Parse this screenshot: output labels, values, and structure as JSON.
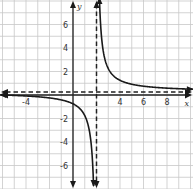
{
  "chart_data": {
    "type": "line",
    "title": "",
    "xlabel": "x",
    "ylabel": "y",
    "xlim": [
      -6.2,
      10.2
    ],
    "ylim": [
      -8,
      8
    ],
    "grid": true,
    "x_tick_labels": [
      "-4",
      "4",
      "6",
      "8"
    ],
    "x_tick_values": [
      -4,
      4,
      6,
      8
    ],
    "y_tick_labels": [
      "6",
      "4",
      "2",
      "-2",
      "-4",
      "-6"
    ],
    "y_tick_values": [
      6,
      4,
      2,
      -2,
      -4,
      -6
    ],
    "function": "y = 2/(x - 2) + 0.25",
    "asymptotes": {
      "vertical": {
        "x": 2,
        "style": "dashed"
      },
      "horizontal": {
        "y": 0.25,
        "style": "dashed"
      }
    },
    "series": [
      {
        "name": "left branch",
        "points": [
          [
            -6.2,
            0.006
          ],
          [
            -4,
            -0.083
          ],
          [
            -2,
            -0.25
          ],
          [
            0,
            -0.75
          ],
          [
            1,
            -1.75
          ],
          [
            1.5,
            -3.75
          ],
          [
            1.75,
            -7.75
          ]
        ]
      },
      {
        "name": "right branch",
        "points": [
          [
            2.25,
            8.25
          ],
          [
            2.5,
            4.25
          ],
          [
            3,
            2.25
          ],
          [
            4,
            1.25
          ],
          [
            6,
            0.75
          ],
          [
            8,
            0.583
          ],
          [
            10.2,
            0.494
          ]
        ]
      }
    ]
  },
  "colors": {
    "grid": "#c8c8c8",
    "axis": "#222222",
    "curve": "#1a1a1a",
    "background": "#ffffff"
  }
}
